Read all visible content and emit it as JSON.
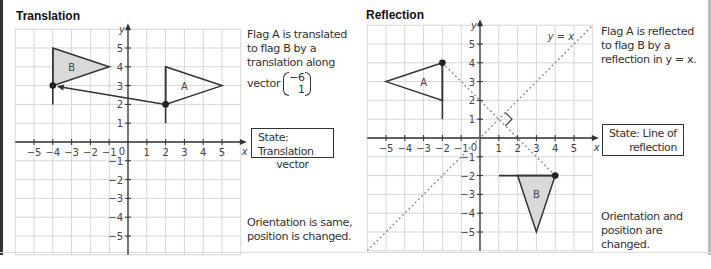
{
  "panels": [
    {
      "id": "translation",
      "title": "Translation",
      "description": [
        "Flag A is translated",
        "to flag B by a",
        "translation along"
      ],
      "vector_prefix": "vector",
      "vector": [
        "−6",
        "1"
      ],
      "state_box": [
        "State: Translation",
        "vector"
      ],
      "conclusion": [
        "Orientation is same,",
        "position is changed."
      ],
      "axis_labels": {
        "x": "x",
        "y": "y"
      },
      "origin_label": "0",
      "x_ticks": [
        "−5",
        "−4",
        "−3",
        "−2",
        "−1",
        "1",
        "2",
        "3",
        "4",
        "5"
      ],
      "y_ticks": [
        "5",
        "4",
        "3",
        "2",
        "1",
        "−1",
        "−2",
        "−3",
        "−4",
        "−5"
      ],
      "flag_a_label": "A",
      "flag_b_label": "B"
    },
    {
      "id": "reflection",
      "title": "Reflection",
      "description": [
        "Flag A is reflected",
        "to flag B by a",
        "reflection in y = x."
      ],
      "state_box": [
        "State: Line of",
        "reflection"
      ],
      "conclusion": [
        "Orientation and",
        "position are changed."
      ],
      "mirror_line_label": "y = x",
      "axis_labels": {
        "x": "x",
        "y": "y"
      },
      "origin_label": "0",
      "x_ticks": [
        "−5",
        "−4",
        "−3",
        "−2",
        "−1",
        "1",
        "2",
        "3",
        "4",
        "5"
      ],
      "y_ticks": [
        "5",
        "4",
        "3",
        "2",
        "1",
        "−1",
        "−2",
        "−3",
        "−4",
        "−5"
      ],
      "flag_a_label": "A",
      "flag_b_label": "B"
    }
  ],
  "geometry": {
    "translation": {
      "flag_a": {
        "pole": [
          [
            2,
            1
          ],
          [
            2,
            4
          ]
        ],
        "triangle": [
          [
            2,
            4
          ],
          [
            5,
            3
          ],
          [
            2,
            2
          ]
        ]
      },
      "flag_b": {
        "pole": [
          [
            -4,
            2
          ],
          [
            -4,
            5
          ]
        ],
        "triangle": [
          [
            -4,
            5
          ],
          [
            -1,
            4
          ],
          [
            -4,
            3
          ]
        ]
      },
      "arrow": {
        "from": [
          2,
          2
        ],
        "to": [
          -4,
          3
        ]
      }
    },
    "reflection": {
      "flag_a": {
        "pole": [
          [
            -2,
            1
          ],
          [
            -2,
            4
          ]
        ],
        "triangle": [
          [
            -2,
            4
          ],
          [
            -5,
            3
          ],
          [
            -2,
            2
          ]
        ]
      },
      "flag_b": {
        "pole": [
          [
            1,
            -2
          ],
          [
            4,
            -2
          ]
        ],
        "triangle": [
          [
            4,
            -2
          ],
          [
            3,
            -5
          ],
          [
            2,
            -2
          ]
        ]
      },
      "mirror_line": "y = x",
      "perpendicular": {
        "from": [
          -2,
          4
        ],
        "to": [
          4,
          -2
        ]
      }
    }
  },
  "colors": {
    "grid": "#d6d6d6",
    "axis": "#333333",
    "flag_b_fill": "#d9d9d9",
    "dotted": "#888888"
  }
}
